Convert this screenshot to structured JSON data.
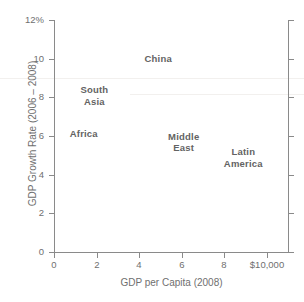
{
  "chart_data": {
    "type": "scatter",
    "title": "",
    "xlabel": "GDP per Capita (2008)",
    "ylabel": "GDP Growth Rate (2006 – 2008)",
    "xlim": [
      0,
      11
    ],
    "ylim": [
      0,
      12
    ],
    "grid": false,
    "legend": "none",
    "x_ticks": [
      {
        "value": 0,
        "label": "0"
      },
      {
        "value": 2,
        "label": "2"
      },
      {
        "value": 4,
        "label": "4"
      },
      {
        "value": 6,
        "label": "6"
      },
      {
        "value": 8,
        "label": "8"
      },
      {
        "value": 10,
        "label": "$10,000"
      }
    ],
    "y_ticks": [
      {
        "value": 0,
        "label": "0"
      },
      {
        "value": 2,
        "label": "2"
      },
      {
        "value": 4,
        "label": "4"
      },
      {
        "value": 6,
        "label": "6"
      },
      {
        "value": 8,
        "label": "8"
      },
      {
        "value": 10,
        "label": "10"
      },
      {
        "value": 12,
        "label": "12%"
      }
    ],
    "points": [
      {
        "label": "China",
        "x": 4.9,
        "y": 10.0
      },
      {
        "label": "South\nAsia",
        "x": 1.9,
        "y": 8.1
      },
      {
        "label": "Africa",
        "x": 1.4,
        "y": 6.1
      },
      {
        "label": "Middle\nEast",
        "x": 6.1,
        "y": 5.7
      },
      {
        "label": "Latin\nAmerica",
        "x": 8.9,
        "y": 4.9
      }
    ],
    "colors": {
      "axis": "#8a8a8a",
      "tick_label": "#6f6f6f",
      "point_label": "#636363",
      "background": "#ffffff"
    }
  }
}
